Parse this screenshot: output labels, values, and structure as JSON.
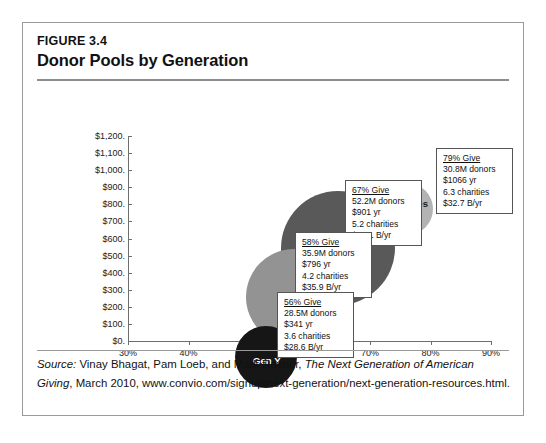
{
  "figure": {
    "number": "FIGURE 3.4",
    "title": "Donor Pools by Generation"
  },
  "source": {
    "label": "Source:",
    "authors": " Vinay Bhagat, Pam Loeb, and Mark Rovner, ",
    "work": "The Next Generation of American Giving",
    "rest": ", March 2010, www.convio.com/signup/next-generation/next-generation-resources.html."
  },
  "chart_data": {
    "type": "scatter",
    "title": "Donor Pools by Generation",
    "xlabel": "",
    "ylabel": "",
    "xlim": [
      30,
      90
    ],
    "ylim": [
      0,
      1200
    ],
    "xticks": [
      "30%",
      "40%",
      "50%",
      "60%",
      "70%",
      "80%",
      "90%"
    ],
    "yticks": [
      "$1,200.",
      "$1,100.",
      "$1,000.",
      "$900.",
      "$800.",
      "$700.",
      "$600.",
      "$500.",
      "$400.",
      "$300.",
      "$200.",
      "$100.",
      "$0."
    ],
    "grid": false,
    "legend": "none",
    "bubble_size_meaning": "donor pool size (millions of donors)",
    "points": [
      {
        "name": "Matures",
        "label": "Matures",
        "percent_give": 79,
        "percent_give_text": "79% Give",
        "donors_text": "30.8M donors",
        "donors_millions": 30.8,
        "annual_gift_text": "$1066 yr",
        "annual_gift": 1066,
        "charities_text": "6.3 charities",
        "charities": 6.3,
        "total_text": "$32.7 B/yr",
        "total_billions": 32.7,
        "color": "#b3b3b3",
        "label_color": "dark"
      },
      {
        "name": "Boomers",
        "label": "Boomers",
        "percent_give": 67,
        "percent_give_text": "67% Give",
        "donors_text": "52.2M donors",
        "donors_millions": 52.2,
        "annual_gift_text": "$901 yr",
        "annual_gift": 901,
        "charities_text": "5.2 charities",
        "charities": 5.2,
        "total_text": "$47.1 B/yr",
        "total_billions": 47.1,
        "color": "#595959",
        "label_color": "light"
      },
      {
        "name": "Gen X",
        "label": "Gen X",
        "percent_give": 58,
        "percent_give_text": "58% Give",
        "donors_text": "35.9M donors",
        "donors_millions": 35.9,
        "annual_gift_text": "$796 yr",
        "annual_gift": 796,
        "charities_text": "4.2 charities",
        "charities": 4.2,
        "total_text": "$35.9 B/yr",
        "total_billions": 35.9,
        "color": "#939393",
        "label_color": "light"
      },
      {
        "name": "Gen Y",
        "label": "Gen Y",
        "percent_give": 56,
        "percent_give_text": "56% Give",
        "donors_text": "28.5M donors",
        "donors_millions": 28.5,
        "annual_gift_text": "$341 yr",
        "annual_gift": 341,
        "charities_text": "3.6 charities",
        "charities": 3.6,
        "total_text": "$28.6 B/yr",
        "total_billions": 28.6,
        "color": "#161616",
        "label_color": "light"
      }
    ]
  }
}
